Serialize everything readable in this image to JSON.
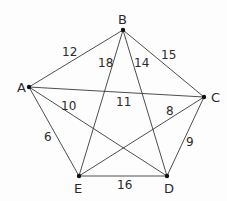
{
  "diagram": {
    "type": "weighted-complete-graph",
    "nodes": [
      {
        "id": "A",
        "label": "A",
        "x": 29,
        "y": 87,
        "label_x": 17,
        "label_y": 92
      },
      {
        "id": "B",
        "label": "B",
        "x": 123,
        "y": 30,
        "label_x": 118,
        "label_y": 24
      },
      {
        "id": "C",
        "label": "C",
        "x": 204,
        "y": 97,
        "label_x": 211,
        "label_y": 102
      },
      {
        "id": "D",
        "label": "D",
        "x": 167,
        "y": 176,
        "label_x": 164,
        "label_y": 193
      },
      {
        "id": "E",
        "label": "E",
        "x": 79,
        "y": 176,
        "label_x": 74,
        "label_y": 193
      }
    ],
    "edges": [
      {
        "from": "A",
        "to": "B",
        "weight": "12",
        "label_x": 62,
        "label_y": 56
      },
      {
        "from": "B",
        "to": "E",
        "weight": "18",
        "label_x": 98,
        "label_y": 67
      },
      {
        "from": "B",
        "to": "D",
        "weight": "14",
        "label_x": 134,
        "label_y": 67
      },
      {
        "from": "B",
        "to": "C",
        "weight": "15",
        "label_x": 161,
        "label_y": 59
      },
      {
        "from": "A",
        "to": "C",
        "weight": "11",
        "label_x": 116,
        "label_y": 106
      },
      {
        "from": "A",
        "to": "D",
        "weight": "10",
        "label_x": 61,
        "label_y": 110
      },
      {
        "from": "C",
        "to": "E",
        "weight": "8",
        "label_x": 166,
        "label_y": 115
      },
      {
        "from": "C",
        "to": "D",
        "weight": "9",
        "label_x": 186,
        "label_y": 146
      },
      {
        "from": "A",
        "to": "E",
        "weight": "6",
        "label_x": 44,
        "label_y": 141
      },
      {
        "from": "E",
        "to": "D",
        "weight": "16",
        "label_x": 117,
        "label_y": 189
      }
    ]
  }
}
